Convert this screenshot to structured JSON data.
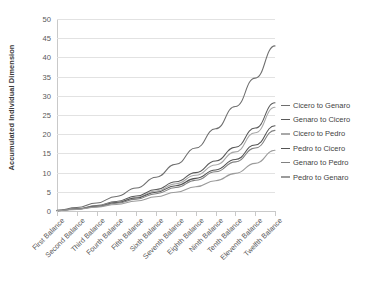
{
  "chart_data": {
    "type": "line",
    "title": "",
    "xlabel": "",
    "ylabel": "Accumulated Individual Dimension",
    "ylim": [
      0,
      50
    ],
    "yticks": [
      0,
      5,
      10,
      15,
      20,
      25,
      30,
      35,
      40,
      45,
      50
    ],
    "grid": true,
    "legend_position": "right",
    "categories": [
      "First Balance",
      "Second Balance",
      "Third Balance",
      "Fourth Balance",
      "Fifth Balance",
      "Sixth Balance",
      "Seventh Balance",
      "Eighth Balance",
      "Ninth Balance",
      "Tenth Balance",
      "Eleventh Balance",
      "Twelfth Balance"
    ],
    "series": [
      {
        "name": "Cicero to Genaro",
        "color": "#6e6e6e",
        "values": [
          0.2,
          0.9,
          2.1,
          3.8,
          6.0,
          8.8,
          12.2,
          16.4,
          21.4,
          27.2,
          34.6,
          43.0
        ]
      },
      {
        "name": "Genaro to Cicero",
        "color": "#5a5a5a",
        "values": [
          0.1,
          0.6,
          1.4,
          2.5,
          3.9,
          5.6,
          7.6,
          10.0,
          13.0,
          16.6,
          21.6,
          28.2
        ]
      },
      {
        "name": "Cicero to Pedro",
        "color": "#a8a8a8",
        "values": [
          0.1,
          0.5,
          1.3,
          2.3,
          3.6,
          5.2,
          7.1,
          9.3,
          12.0,
          15.4,
          20.4,
          27.0
        ]
      },
      {
        "name": "Pedro to Cicero",
        "color": "#545454",
        "values": [
          0.1,
          0.5,
          1.2,
          2.2,
          3.4,
          4.9,
          6.6,
          8.5,
          10.7,
          13.4,
          17.2,
          22.2
        ]
      },
      {
        "name": "Genaro to Pedro",
        "color": "#818181",
        "values": [
          0.1,
          0.5,
          1.1,
          2.0,
          3.1,
          4.5,
          6.1,
          8.0,
          10.2,
          12.8,
          16.4,
          21.0
        ]
      },
      {
        "name": "Pedro to Genaro",
        "color": "#9b9b9b",
        "values": [
          0.1,
          0.4,
          1.0,
          1.7,
          2.6,
          3.7,
          4.9,
          6.3,
          7.9,
          9.8,
          12.4,
          15.8
        ]
      }
    ]
  }
}
